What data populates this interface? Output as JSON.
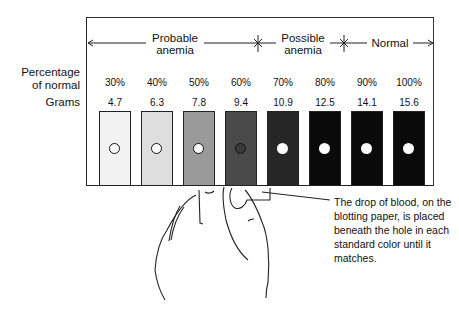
{
  "ranges": [
    {
      "label_line1": "Probable",
      "label_line2": "anemia"
    },
    {
      "label_line1": "Possible",
      "label_line2": "anemia"
    },
    {
      "label_line1": "Normal",
      "label_line2": ""
    }
  ],
  "row_labels": {
    "percentage_line1": "Percentage",
    "percentage_line2": "of normal",
    "grams": "Grams"
  },
  "swatches": [
    {
      "percent": "30%",
      "grams": "4.7",
      "color": "#f2f2f2",
      "hole_border": "#111"
    },
    {
      "percent": "40%",
      "grams": "6.3",
      "color": "#dedede",
      "hole_border": "#111"
    },
    {
      "percent": "50%",
      "grams": "7.8",
      "color": "#9a9a9a",
      "hole_border": "#111"
    },
    {
      "percent": "60%",
      "grams": "9.4",
      "color": "#4a4a4a",
      "hole_border": "#111"
    },
    {
      "percent": "70%",
      "grams": "10.9",
      "color": "#262626",
      "hole_border": "none"
    },
    {
      "percent": "80%",
      "grams": "12.5",
      "color": "#0a0a0a",
      "hole_border": "none"
    },
    {
      "percent": "90%",
      "grams": "14.1",
      "color": "#0a0a0a",
      "hole_border": "none"
    },
    {
      "percent": "100%",
      "grams": "15.6",
      "color": "#0a0a0a",
      "hole_border": "none"
    }
  ],
  "caption": "The drop of blood, on the blotting paper, is placed beneath the hole in each standard color until it matches."
}
